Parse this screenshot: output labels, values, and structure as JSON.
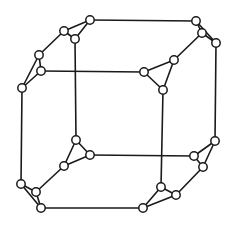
{
  "diagram": {
    "colors": {
      "stroke": "#1a1a1a",
      "node_fill": "#ffffff",
      "background": "#ffffff"
    },
    "node_radius": 4.2,
    "nodes": [
      {
        "id": 0,
        "x": 22,
        "y": 88
      },
      {
        "id": 1,
        "x": 39,
        "y": 55
      },
      {
        "id": 2,
        "x": 41,
        "y": 71
      },
      {
        "id": 3,
        "x": 64,
        "y": 31
      },
      {
        "id": 4,
        "x": 75,
        "y": 39
      },
      {
        "id": 5,
        "x": 90,
        "y": 20
      },
      {
        "id": 6,
        "x": 196,
        "y": 21
      },
      {
        "id": 7,
        "x": 202,
        "y": 33
      },
      {
        "id": 8,
        "x": 216,
        "y": 43
      },
      {
        "id": 9,
        "x": 174,
        "y": 60
      },
      {
        "id": 10,
        "x": 144,
        "y": 72
      },
      {
        "id": 11,
        "x": 163,
        "y": 90
      },
      {
        "id": 12,
        "x": 76,
        "y": 140
      },
      {
        "id": 13,
        "x": 90,
        "y": 155
      },
      {
        "id": 14,
        "x": 64,
        "y": 166
      },
      {
        "id": 15,
        "x": 21,
        "y": 184
      },
      {
        "id": 16,
        "x": 36,
        "y": 192
      },
      {
        "id": 17,
        "x": 41,
        "y": 208
      },
      {
        "id": 18,
        "x": 215,
        "y": 141
      },
      {
        "id": 19,
        "x": 194,
        "y": 156
      },
      {
        "id": 20,
        "x": 203,
        "y": 167
      },
      {
        "id": 21,
        "x": 161,
        "y": 187
      },
      {
        "id": 22,
        "x": 176,
        "y": 195
      },
      {
        "id": 23,
        "x": 143,
        "y": 208
      }
    ],
    "edges": [
      [
        0,
        1
      ],
      [
        0,
        2
      ],
      [
        1,
        2
      ],
      [
        1,
        3
      ],
      [
        3,
        5
      ],
      [
        3,
        4
      ],
      [
        4,
        5
      ],
      [
        5,
        6
      ],
      [
        6,
        8
      ],
      [
        6,
        7
      ],
      [
        7,
        8
      ],
      [
        7,
        9
      ],
      [
        9,
        10
      ],
      [
        9,
        11
      ],
      [
        10,
        11
      ],
      [
        10,
        2
      ],
      [
        4,
        12
      ],
      [
        11,
        21
      ],
      [
        8,
        18
      ],
      [
        0,
        15
      ],
      [
        12,
        13
      ],
      [
        12,
        14
      ],
      [
        13,
        14
      ],
      [
        14,
        16
      ],
      [
        15,
        16
      ],
      [
        15,
        17
      ],
      [
        16,
        17
      ],
      [
        13,
        19
      ],
      [
        17,
        23
      ],
      [
        18,
        19
      ],
      [
        18,
        20
      ],
      [
        19,
        20
      ],
      [
        20,
        22
      ],
      [
        21,
        22
      ],
      [
        21,
        23
      ],
      [
        22,
        23
      ]
    ]
  }
}
